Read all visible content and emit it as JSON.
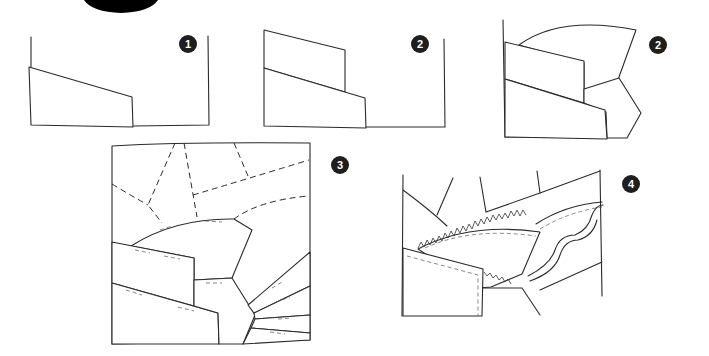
{
  "figure": {
    "type": "instructional-illustration",
    "header_shape": "black-semicircle",
    "colors": {
      "line": "#2a2a2a",
      "badge": "#1e1e1e",
      "badge_text": "#ffffff",
      "background": "#ffffff"
    }
  },
  "steps": [
    {
      "id": "step-1",
      "badge": "1",
      "description": "first strip on base"
    },
    {
      "id": "step-2a",
      "badge": "2",
      "description": "second strip layered"
    },
    {
      "id": "step-2b",
      "badge": "2",
      "description": "arc and pentagon pieces added"
    },
    {
      "id": "step-3",
      "badge": "3",
      "description": "full block with dashed placement lines"
    },
    {
      "id": "step-4",
      "badge": "4",
      "description": "gathered trim and ribbon applied"
    }
  ]
}
